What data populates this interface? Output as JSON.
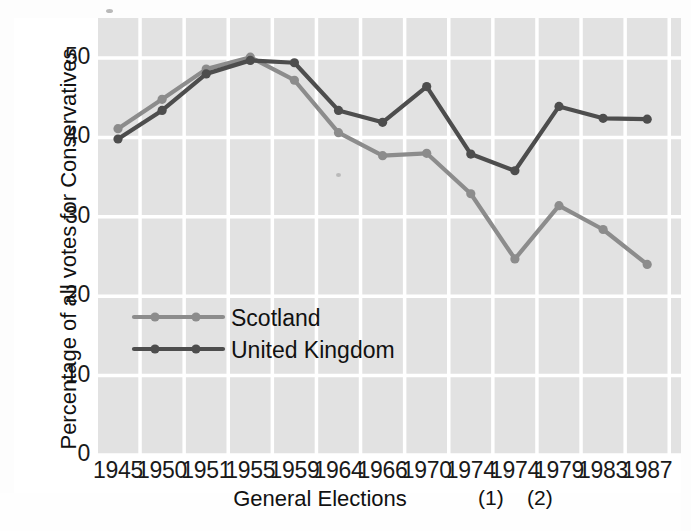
{
  "chart_data": {
    "type": "line",
    "title": "",
    "xlabel": "General Elections",
    "ylabel": "Percentage of all votes for Conservatives",
    "categories": [
      "1945",
      "1950",
      "1951",
      "1955",
      "1959",
      "1964",
      "1966",
      "1970",
      "1974",
      "1974",
      "1979",
      "1983",
      "1987"
    ],
    "category_footnotes": [
      "",
      "",
      "",
      "",
      "",
      "",
      "",
      "",
      "(1)",
      "(2)",
      "",
      "",
      ""
    ],
    "ylim": [
      0,
      50
    ],
    "yticks": [
      0,
      10,
      20,
      30,
      40,
      50
    ],
    "grid": true,
    "legend_position": "center-left-inside",
    "series": [
      {
        "name": "Scotland",
        "color": "#8c8c8c",
        "values": [
          41.1,
          44.8,
          48.6,
          50.1,
          47.2,
          40.6,
          37.7,
          38.0,
          32.9,
          24.7,
          31.4,
          28.4,
          24.0
        ]
      },
      {
        "name": "United Kingdom",
        "color": "#4d4d4d",
        "values": [
          39.8,
          43.4,
          48.0,
          49.7,
          49.4,
          43.4,
          41.9,
          46.4,
          37.9,
          35.8,
          43.9,
          42.4,
          42.3
        ]
      }
    ]
  },
  "axes": {
    "ytick_labels": [
      "50",
      "40",
      "30",
      "20",
      "10",
      "0"
    ],
    "xtick_labels": [
      "1945",
      "1950",
      "1951",
      "1955",
      "1959",
      "1964",
      "1966",
      "1970",
      "1974",
      "1974",
      "1979",
      "1983",
      "1987"
    ],
    "xlabel": "General Elections",
    "ylabel": "Percentage of all votes for Conservatives",
    "footnote_1": "(1)",
    "footnote_2": "(2)"
  },
  "legend": {
    "items": [
      {
        "label": "Scotland",
        "color": "#8c8c8c"
      },
      {
        "label": "United Kingdom",
        "color": "#4d4d4d"
      }
    ]
  },
  "colors": {
    "plot_background": "#e2e2e2",
    "gridline": "#ffffff",
    "page_background": "#fdfdfd",
    "text": "#111111",
    "scotland": "#8c8c8c",
    "united_kingdom": "#4d4d4d"
  }
}
